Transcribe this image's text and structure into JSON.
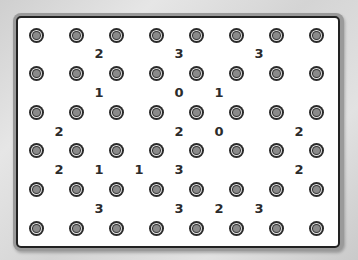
{
  "game": {
    "type": "slitherlink",
    "dot_columns": 8,
    "dot_rows": 6,
    "cell_columns": 7,
    "cell_rows": 5,
    "clues": [
      [
        null,
        "2",
        null,
        "3",
        null,
        "3",
        null
      ],
      [
        null,
        "1",
        null,
        "0",
        "1",
        null,
        null
      ],
      [
        "2",
        null,
        null,
        "2",
        "0",
        null,
        "2"
      ],
      [
        "2",
        "1",
        "1",
        "3",
        null,
        null,
        "2"
      ],
      [
        null,
        "3",
        null,
        "3",
        "2",
        "3",
        null
      ]
    ]
  },
  "colors": {
    "board_background": "#ffffff",
    "frame": "#9a9a9a",
    "border": "#222222",
    "dot_outer": "#2a2a2a",
    "dot_inner": "#8a8a8a",
    "clue_text": "#2b2b2b"
  }
}
